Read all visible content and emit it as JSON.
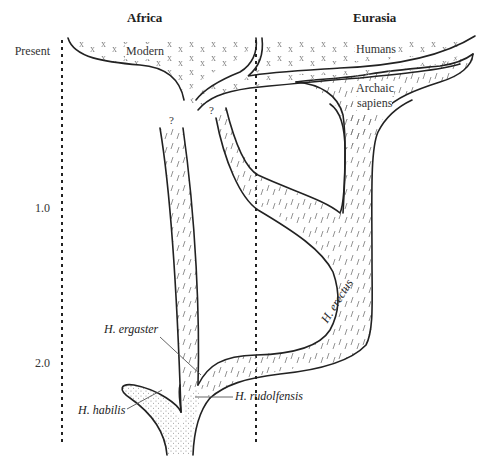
{
  "regions": {
    "africa": "Africa",
    "eurasia": "Eurasia"
  },
  "time_axis": {
    "present": "Present",
    "mark_1": "1.0",
    "mark_2": "2.0"
  },
  "lineages": {
    "modern": "Modern",
    "humans": "Humans",
    "archaic_line1": "Archaic",
    "archaic_line2": "sapiens"
  },
  "species": {
    "ergaster": "H. ergaster",
    "erectus": "H. erectus",
    "habilis": "H. habilis",
    "rudolfensis": "H. rudolfensis"
  },
  "uncertain": {
    "q1": "?",
    "q2": "?"
  },
  "legend_patterns": {
    "modern_humans": "x-marks",
    "erectus_archaic": "dashes",
    "habilis_rudolfensis": "stipple"
  },
  "colors": {
    "outline": "#222222",
    "pattern": "#888888",
    "background": "#ffffff"
  }
}
